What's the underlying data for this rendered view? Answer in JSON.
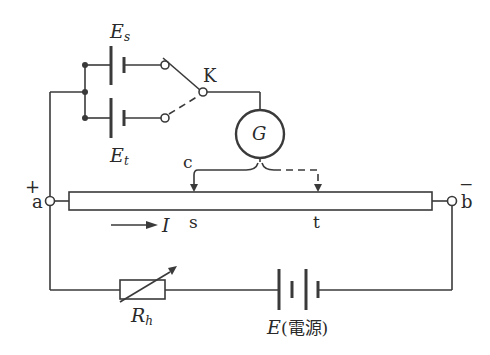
{
  "diagram": {
    "type": "potentiometer circuit",
    "labels": {
      "es_main": "E",
      "es_sub": "s",
      "et_main": "E",
      "et_sub": "t",
      "switch": "K",
      "galvanometer": "G",
      "contact": "c",
      "terminal_a": "a",
      "terminal_b": "b",
      "plus": "+",
      "minus": "−",
      "point_s": "s",
      "point_t": "t",
      "current": "I",
      "rheostat_main": "R",
      "rheostat_sub": "h",
      "source": "E",
      "source_note": "(電源)"
    },
    "colors": {
      "line": "#3a3a3a",
      "background": "#ffffff"
    }
  }
}
